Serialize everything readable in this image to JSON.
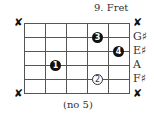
{
  "diagram": {
    "fret_label": "9. Fret",
    "footer": "(no 5)",
    "strings": [
      {
        "muted": true,
        "mute_symbol": "✘",
        "note": ""
      },
      {
        "muted": false,
        "note": "G♯"
      },
      {
        "muted": false,
        "note": "E♯"
      },
      {
        "muted": false,
        "note": "A"
      },
      {
        "muted": false,
        "note": "F♯"
      },
      {
        "muted": true,
        "mute_symbol": "✘",
        "note": ""
      }
    ],
    "frets_shown": 5,
    "fingers": [
      {
        "finger": "3",
        "string": 2,
        "fret": 4,
        "style": "filled"
      },
      {
        "finger": "4",
        "string": 3,
        "fret": 5,
        "style": "filled"
      },
      {
        "finger": "1",
        "string": 4,
        "fret": 2,
        "style": "filled"
      },
      {
        "finger": "2",
        "string": 5,
        "fret": 4,
        "style": "outline"
      }
    ],
    "mute_left_top": "✘",
    "mute_left_bottom": "✘",
    "mute_right_top": "✘",
    "mute_right_bottom": "✘"
  }
}
